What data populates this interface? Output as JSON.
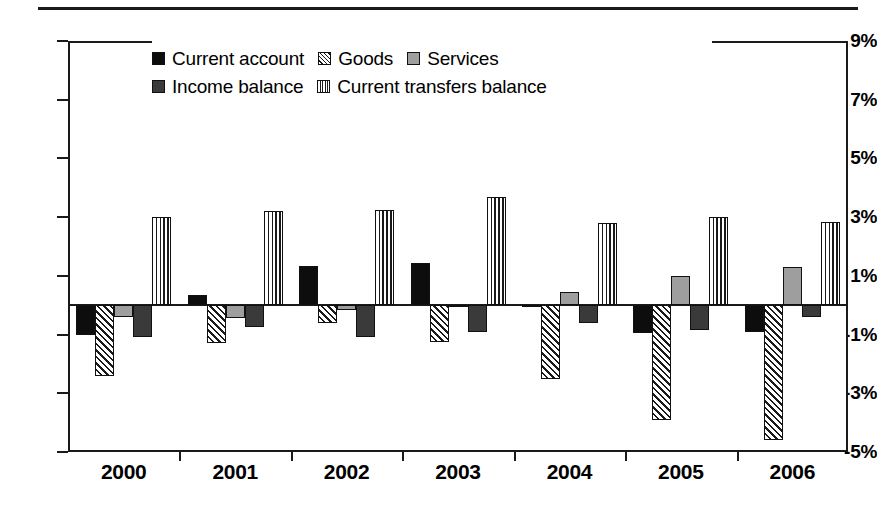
{
  "chart_data": {
    "type": "bar",
    "title": "",
    "xlabel": "",
    "ylabel": "",
    "ylim": [
      -5,
      9
    ],
    "yticks": [
      9,
      7,
      5,
      3,
      1,
      -1,
      -3,
      -5
    ],
    "ytick_labels": [
      "9%",
      "7%",
      "5%",
      "3%",
      "1%",
      "-1%",
      "-3%",
      "-5%"
    ],
    "grid": true,
    "legend_position": "top-center",
    "categories": [
      "2000",
      "2001",
      "2002",
      "2003",
      "2004",
      "2005",
      "2006"
    ],
    "series": [
      {
        "name": "Current account",
        "pattern": "solid-black",
        "values": [
          -1.0,
          0.35,
          1.35,
          1.45,
          -0.05,
          -0.95,
          -0.9
        ]
      },
      {
        "name": "Goods",
        "pattern": "diagonal-hatch",
        "values": [
          -2.4,
          -1.3,
          -0.6,
          -1.25,
          -2.5,
          -3.9,
          -4.6
        ]
      },
      {
        "name": "Services",
        "pattern": "solid-gray",
        "values": [
          -0.4,
          -0.45,
          -0.15,
          -0.05,
          0.45,
          1.0,
          1.3
        ]
      },
      {
        "name": "Income balance",
        "pattern": "solid-darkgray",
        "values": [
          -1.1,
          -0.75,
          -1.1,
          -0.9,
          -0.6,
          -0.85,
          -0.4
        ]
      },
      {
        "name": "Current transfers balance",
        "pattern": "vertical-stripe",
        "values": [
          3.0,
          3.2,
          3.25,
          3.7,
          2.8,
          3.0,
          2.85
        ]
      }
    ]
  },
  "legend": {
    "row1": [
      {
        "label": "Current account",
        "swatch": "solid-black"
      },
      {
        "label": "Goods",
        "swatch": "diagonal-hatch"
      },
      {
        "label": "Services",
        "swatch": "solid-gray"
      }
    ],
    "row2": [
      {
        "label": "Income balance",
        "swatch": "solid-darkgray"
      },
      {
        "label": "Current transfers balance",
        "swatch": "vertical-stripe"
      }
    ]
  }
}
